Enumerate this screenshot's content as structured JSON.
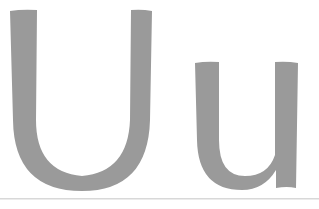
{
  "glyphs": {
    "uppercase": "U",
    "lowercase": "u",
    "display": "Uu"
  },
  "colors": {
    "glyph": "#9a9a9a",
    "rule": "#d8d8d8",
    "background": "#ffffff"
  }
}
